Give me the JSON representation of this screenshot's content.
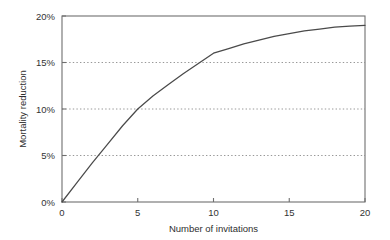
{
  "chart_data": {
    "type": "line",
    "title": "",
    "xlabel": "Number of invitations",
    "ylabel": "Mortality reduction",
    "xlim": [
      0,
      20
    ],
    "ylim": [
      0,
      20
    ],
    "grid": true,
    "grid_axis": "y",
    "legend": false,
    "x_ticks": [
      0,
      5,
      10,
      15,
      20
    ],
    "x_tick_labels": [
      "0",
      "5",
      "10",
      "15",
      "20"
    ],
    "y_ticks": [
      0,
      5,
      10,
      15,
      20
    ],
    "y_tick_labels": [
      "0%",
      "5%",
      "10%",
      "15%",
      "20%"
    ],
    "series": [
      {
        "name": "Mortality reduction",
        "color": "#4a4a4a",
        "x": [
          0,
          1,
          2,
          3,
          4,
          5,
          6,
          7,
          8,
          9,
          10,
          11,
          12,
          13,
          14,
          15,
          16,
          17,
          18,
          19,
          20
        ],
        "values": [
          0.0,
          2.1,
          4.2,
          6.2,
          8.2,
          10.0,
          11.4,
          12.6,
          13.8,
          14.9,
          16.0,
          16.5,
          17.0,
          17.4,
          17.8,
          18.1,
          18.4,
          18.6,
          18.8,
          18.9,
          19.0
        ]
      }
    ],
    "annotations": []
  },
  "axes": {
    "y_label": "Mortality reduction",
    "x_label": "Number of invitations"
  },
  "colors": {
    "curve": "#4a4a4a",
    "frame": "#6f6f6f",
    "grid": "#8c8c8c",
    "text": "#333333",
    "background": "#ffffff"
  }
}
